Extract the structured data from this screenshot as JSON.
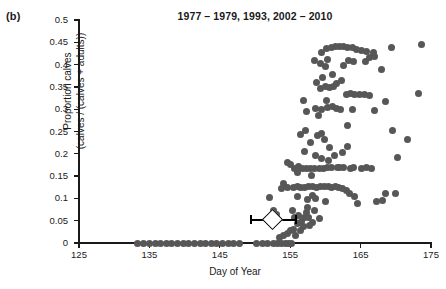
{
  "panel": {
    "label": "(b)"
  },
  "chart_data": {
    "type": "scatter",
    "title": "1977 – 1979, 1993, 2002 – 2010",
    "xlabel": "Day of Year",
    "ylabel": "Proportion calves (calves / (calves + adults))",
    "ylabel_line1": "Proportion calves",
    "ylabel_line2": "(calves / (calves + adults))",
    "xlim": [
      125,
      175
    ],
    "ylim": [
      0,
      0.5
    ],
    "xticks": [
      125,
      135,
      145,
      155,
      165,
      175
    ],
    "yticks": [
      0,
      0.05,
      0.1,
      0.15,
      0.2,
      0.25,
      0.3,
      0.35,
      0.4,
      0.45,
      0.5
    ],
    "ytick_labels": [
      "0",
      "0.05",
      "0.1",
      "0.15",
      "0.2",
      "0.25",
      "0.3",
      "0.35",
      "0.4",
      "0.45",
      "0.5"
    ],
    "xtick_labels": [
      "125",
      "135",
      "145",
      "155",
      "165",
      "175"
    ],
    "grid": false,
    "legend": false,
    "marker_color": "#575757",
    "marker_size_px": 7,
    "series": [
      {
        "name": "observations",
        "points": [
          [
            133.3,
            0
          ],
          [
            134.2,
            0
          ],
          [
            135.0,
            0
          ],
          [
            135.8,
            0
          ],
          [
            136.6,
            0
          ],
          [
            137.4,
            0
          ],
          [
            138.2,
            0
          ],
          [
            139.0,
            0
          ],
          [
            139.8,
            0
          ],
          [
            140.6,
            0
          ],
          [
            141.4,
            0
          ],
          [
            142.2,
            0
          ],
          [
            143.0,
            0
          ],
          [
            143.8,
            0
          ],
          [
            144.6,
            0
          ],
          [
            145.4,
            0
          ],
          [
            146.2,
            0
          ],
          [
            147.0,
            0
          ],
          [
            147.8,
            0
          ],
          [
            150.2,
            0
          ],
          [
            151.0,
            0
          ],
          [
            151.8,
            0
          ],
          [
            152.6,
            0
          ],
          [
            153.2,
            0
          ],
          [
            153.8,
            0
          ],
          [
            154.3,
            0
          ],
          [
            154.8,
            0
          ],
          [
            155.2,
            0
          ],
          [
            153.5,
            0.012
          ],
          [
            154.0,
            0.016
          ],
          [
            154.6,
            0.022
          ],
          [
            155.0,
            0.027
          ],
          [
            155.4,
            0.031
          ],
          [
            155.8,
            0.016
          ],
          [
            156.1,
            0.043
          ],
          [
            156.4,
            0.028
          ],
          [
            156.6,
            0.048
          ],
          [
            156.9,
            0.038
          ],
          [
            155.6,
            0.058
          ],
          [
            156.2,
            0.062
          ],
          [
            157.0,
            0.057
          ],
          [
            153.1,
            0.063
          ],
          [
            152.6,
            0.072
          ],
          [
            155.3,
            0.073
          ],
          [
            157.3,
            0.069
          ],
          [
            157.6,
            0.058
          ],
          [
            152.1,
            0.101
          ],
          [
            154.1,
            0.133
          ],
          [
            156.0,
            0.104
          ],
          [
            157.4,
            0.098
          ],
          [
            158.2,
            0.106
          ],
          [
            158.6,
            0.099
          ],
          [
            153.7,
            0.122
          ],
          [
            154.6,
            0.125
          ],
          [
            155.4,
            0.125
          ],
          [
            156.0,
            0.126
          ],
          [
            156.5,
            0.125
          ],
          [
            157.0,
            0.124
          ],
          [
            157.6,
            0.127
          ],
          [
            158.2,
            0.126
          ],
          [
            158.8,
            0.125
          ],
          [
            159.3,
            0.126
          ],
          [
            159.9,
            0.127
          ],
          [
            160.4,
            0.126
          ],
          [
            160.9,
            0.124
          ],
          [
            161.4,
            0.126
          ],
          [
            161.9,
            0.125
          ],
          [
            162.4,
            0.123
          ],
          [
            163.0,
            0.117
          ],
          [
            163.4,
            0.11
          ],
          [
            164.1,
            0.104
          ],
          [
            164.6,
            0.089
          ],
          [
            167.3,
            0.094
          ],
          [
            168.1,
            0.095
          ],
          [
            168.6,
            0.111
          ],
          [
            170.0,
            0.11
          ],
          [
            166.5,
            0.168
          ],
          [
            165.1,
            0.168
          ],
          [
            163.6,
            0.168
          ],
          [
            162.6,
            0.169
          ],
          [
            161.7,
            0.17
          ],
          [
            160.9,
            0.17
          ],
          [
            160.3,
            0.17
          ],
          [
            159.7,
            0.168
          ],
          [
            159.1,
            0.168
          ],
          [
            158.5,
            0.167
          ],
          [
            157.9,
            0.168
          ],
          [
            157.3,
            0.168
          ],
          [
            156.8,
            0.166
          ],
          [
            156.2,
            0.171
          ],
          [
            155.6,
            0.166
          ],
          [
            155.1,
            0.176
          ],
          [
            154.6,
            0.181
          ],
          [
            159.5,
            0.19
          ],
          [
            160.5,
            0.186
          ],
          [
            170.2,
            0.191
          ],
          [
            157.1,
            0.205
          ],
          [
            158.6,
            0.196
          ],
          [
            161.3,
            0.197
          ],
          [
            162.4,
            0.202
          ],
          [
            163.1,
            0.216
          ],
          [
            160.6,
            0.215
          ],
          [
            157.9,
            0.226
          ],
          [
            159.9,
            0.232
          ],
          [
            171.6,
            0.231
          ],
          [
            169.6,
            0.252
          ],
          [
            156.5,
            0.244
          ],
          [
            158.9,
            0.24
          ],
          [
            159.4,
            0.245
          ],
          [
            163.2,
            0.263
          ],
          [
            159.0,
            0.286
          ],
          [
            157.3,
            0.295
          ],
          [
            158.6,
            0.301
          ],
          [
            159.4,
            0.3
          ],
          [
            160.3,
            0.303
          ],
          [
            161.0,
            0.305
          ],
          [
            161.6,
            0.302
          ],
          [
            162.1,
            0.299
          ],
          [
            163.8,
            0.3
          ],
          [
            167.0,
            0.298
          ],
          [
            168.5,
            0.318
          ],
          [
            166.2,
            0.33
          ],
          [
            164.8,
            0.334
          ],
          [
            165.5,
            0.334
          ],
          [
            164.2,
            0.332
          ],
          [
            163.6,
            0.335
          ],
          [
            163.0,
            0.334
          ],
          [
            173.2,
            0.335
          ],
          [
            156.9,
            0.319
          ],
          [
            160.2,
            0.32
          ],
          [
            159.3,
            0.346
          ],
          [
            160.0,
            0.352
          ],
          [
            160.6,
            0.349
          ],
          [
            161.1,
            0.352
          ],
          [
            161.6,
            0.358
          ],
          [
            162.3,
            0.364
          ],
          [
            158.8,
            0.36
          ],
          [
            159.6,
            0.37
          ],
          [
            168.0,
            0.388
          ],
          [
            160.0,
            0.396
          ],
          [
            162.6,
            0.397
          ],
          [
            159.3,
            0.403
          ],
          [
            158.5,
            0.41
          ],
          [
            160.3,
            0.411
          ],
          [
            163.3,
            0.409
          ],
          [
            164.0,
            0.407
          ],
          [
            165.7,
            0.408
          ],
          [
            166.3,
            0.415
          ],
          [
            167.0,
            0.419
          ],
          [
            166.8,
            0.428
          ],
          [
            165.9,
            0.43
          ],
          [
            165.1,
            0.432
          ],
          [
            164.4,
            0.433
          ],
          [
            163.8,
            0.438
          ],
          [
            163.2,
            0.438
          ],
          [
            162.6,
            0.44
          ],
          [
            162.0,
            0.44
          ],
          [
            161.4,
            0.44
          ],
          [
            160.8,
            0.438
          ],
          [
            160.2,
            0.435
          ],
          [
            169.4,
            0.438
          ],
          [
            173.6,
            0.446
          ],
          [
            159.4,
            0.428
          ],
          [
            161.0,
            0.378
          ],
          [
            157.2,
            0.253
          ],
          [
            156.0,
            0.158
          ],
          [
            158.0,
            0.152
          ],
          [
            162.0,
            0.17
          ],
          [
            164.0,
            0.17
          ],
          [
            165.9,
            0.17
          ],
          [
            157.5,
            0.08
          ],
          [
            158.5,
            0.072
          ],
          [
            159.2,
            0.055
          ],
          [
            158.1,
            0.046
          ],
          [
            157.8,
            0.04
          ],
          [
            160.0,
            0.092
          ]
        ]
      }
    ],
    "mean_marker": {
      "shape": "diamond",
      "x": 152.5,
      "y": 0.052,
      "error_x_low": 149.4,
      "error_x_high": 155.7,
      "fill": "#ffffff",
      "stroke": "#000000"
    }
  }
}
